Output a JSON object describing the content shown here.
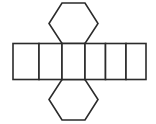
{
  "figure": {
    "name": "hexagonal-prism-net",
    "background_color": "#ffffff",
    "stroke_color": "#2b2b2b",
    "fill_color": "#ffffff",
    "stroke_width": 1.6,
    "canvas": {
      "width": 156,
      "height": 124
    },
    "shapes": {
      "band": {
        "label": "rectangle-band",
        "description": "Row of five congruent rectangles forming the lateral faces",
        "count": 5,
        "x_left": 13,
        "x_right": 146,
        "y_top": 43.5,
        "y_bottom": 79.5,
        "divider_x": [
          39,
          62,
          85,
          105.5,
          126
        ]
      },
      "hexagon_top": {
        "label": "top-hexagon",
        "description": "Hexagonal base attached above the third rectangle",
        "points": "62,3 85,3 98,23.5 85,43.5 62,43.5 49,23.5"
      },
      "hexagon_bottom": {
        "label": "bottom-hexagon",
        "description": "Hexagonal base attached below the third rectangle",
        "points": "62,79.5 85,79.5 98,99.5 85,120 62,120 49,99.5"
      }
    }
  }
}
